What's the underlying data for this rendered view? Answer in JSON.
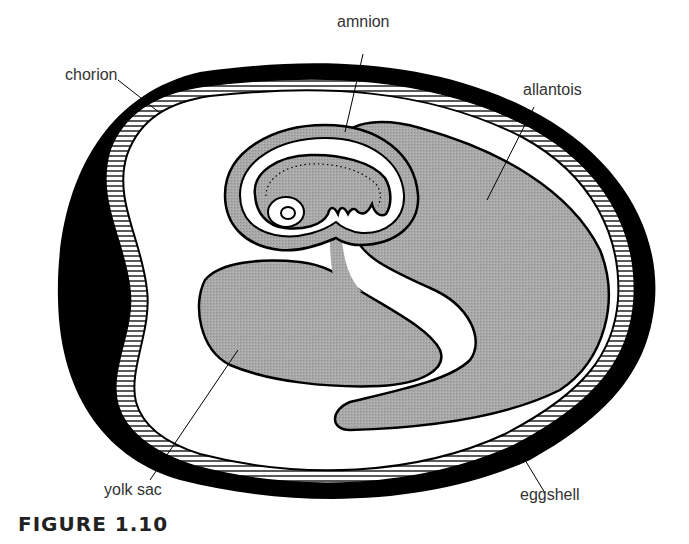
{
  "figure": {
    "caption": "FIGURE 1.10"
  },
  "labels": {
    "chorion": "chorion",
    "amnion": "amnion",
    "allantois": "allantois",
    "yolk_sac": "yolk sac",
    "eggshell": "eggshell"
  },
  "colors": {
    "shell": "#000000",
    "membrane_fill": "#a6a6a6",
    "hatch": "#000000",
    "background": "#ffffff",
    "label_text": "#333333"
  }
}
